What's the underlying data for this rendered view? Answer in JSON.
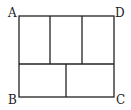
{
  "diagram": {
    "title": "",
    "vertices": {
      "A": {
        "label": "A",
        "x": 19,
        "y": 16
      },
      "B": {
        "label": "B",
        "x": 19,
        "y": 97
      },
      "C": {
        "label": "C",
        "x": 114,
        "y": 97
      },
      "D": {
        "label": "D",
        "x": 114,
        "y": 16
      }
    },
    "top_row_count": 3,
    "bottom_row_count": 2,
    "stroke_color": "#222222"
  }
}
